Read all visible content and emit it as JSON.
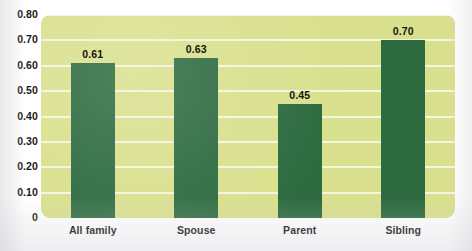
{
  "chart_data": {
    "type": "bar",
    "title": "",
    "xlabel": "",
    "ylabel": "",
    "categories": [
      "All family",
      "Spouse",
      "Parent",
      "Sibling"
    ],
    "values": [
      0.61,
      0.63,
      0.45,
      0.7
    ],
    "value_labels": [
      "0.61",
      "0.63",
      "0.45",
      "0.70"
    ],
    "ylim": [
      0,
      0.8
    ],
    "ytick_labels": [
      "0.80",
      "0.70",
      "0.60",
      "0.50",
      "0.40",
      "0.30",
      "0.20",
      "0.10",
      "0"
    ],
    "ytick_values": [
      0.8,
      0.7,
      0.6,
      0.5,
      0.4,
      0.3,
      0.2,
      0.1,
      0
    ],
    "grid": true,
    "legend": false,
    "legend_position": "none",
    "series": [
      {
        "name": "",
        "values": [
          0.61,
          0.63,
          0.45,
          0.7
        ]
      }
    ]
  },
  "colors": {
    "bar": "#2c6a3f",
    "plot_background": "#d9e08d",
    "gridline": "#f4f6e2",
    "page_background": "#ffffff",
    "text": "#16150f"
  },
  "clipped_title": "........ ........."
}
